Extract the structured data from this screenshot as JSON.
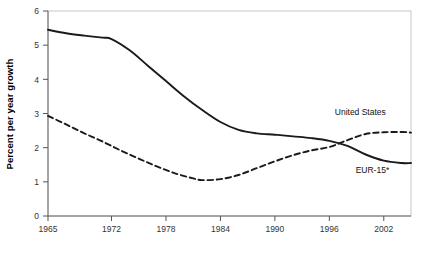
{
  "chart_data": {
    "type": "line",
    "title": "",
    "xlabel": "",
    "ylabel": "Percent per year growth",
    "xlim": [
      1965,
      2005
    ],
    "ylim": [
      0,
      6
    ],
    "grid": false,
    "legend_position": "inline-right",
    "xticks": [
      "1965",
      "1972",
      "1978",
      "1984",
      "1990",
      "1996",
      "2002"
    ],
    "xtick_values": [
      1965,
      1972,
      1978,
      1984,
      1990,
      1996,
      2002
    ],
    "yticks": [
      "0",
      "1",
      "2",
      "3",
      "4",
      "5",
      "6"
    ],
    "ytick_values": [
      0,
      1,
      2,
      3,
      4,
      5,
      6
    ],
    "series": [
      {
        "name": "EUR-15*",
        "style": "solid",
        "color": "#1a1a1a",
        "label_x": 2002.6,
        "label_y": 1.25,
        "x": [
          1965,
          1967,
          1969,
          1971,
          1972,
          1974,
          1976,
          1978,
          1980,
          1982,
          1984,
          1986,
          1988,
          1990,
          1992,
          1994,
          1996,
          1998,
          2000,
          2002,
          2004,
          2005
        ],
        "values": [
          5.45,
          5.35,
          5.28,
          5.22,
          5.18,
          4.85,
          4.4,
          3.95,
          3.5,
          3.1,
          2.75,
          2.52,
          2.42,
          2.38,
          2.33,
          2.28,
          2.2,
          2.05,
          1.8,
          1.62,
          1.55,
          1.55
        ]
      },
      {
        "name": "United States",
        "style": "dashed",
        "color": "#1a1a1a",
        "label_x": 1996.6,
        "label_y": 2.95,
        "x": [
          1965,
          1967,
          1969,
          1971,
          1973,
          1975,
          1977,
          1979,
          1981,
          1982,
          1984,
          1986,
          1988,
          1990,
          1992,
          1994,
          1996,
          1998,
          2000,
          2002,
          2004,
          2005
        ],
        "values": [
          2.93,
          2.68,
          2.42,
          2.18,
          1.92,
          1.68,
          1.45,
          1.25,
          1.1,
          1.05,
          1.08,
          1.2,
          1.4,
          1.6,
          1.78,
          1.92,
          2.02,
          2.22,
          2.4,
          2.45,
          2.46,
          2.44
        ]
      }
    ],
    "annotations": [
      {
        "text": "United States",
        "series": "United States"
      },
      {
        "text": "EUR-15*",
        "series": "EUR-15*"
      }
    ]
  },
  "colors": {
    "line": "#1a1a1a",
    "axis": "#555555",
    "frame": "#c8c8c8",
    "background": "#ffffff"
  }
}
